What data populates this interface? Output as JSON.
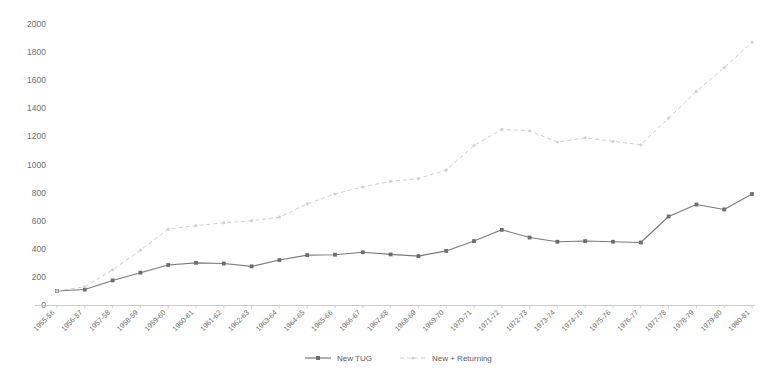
{
  "chart_data": {
    "type": "line",
    "title": "",
    "subtitle": "",
    "xlabel": "",
    "ylabel": "",
    "ylim": [
      0,
      2000
    ],
    "ytick_step": 200,
    "yticks": [
      0,
      200,
      400,
      600,
      800,
      1000,
      1200,
      1400,
      1600,
      1800,
      2000
    ],
    "ytick_labels": [
      "0",
      "200",
      "400",
      "600",
      "800",
      "1000",
      "1200",
      "1400",
      "1600",
      "1800",
      "2000"
    ],
    "grid": false,
    "legend_position": "bottom",
    "categories": [
      "1955-56",
      "1956-57",
      "1957-58",
      "1958-59",
      "1959-60",
      "1960-61",
      "1961-62",
      "1962-63",
      "1963-64",
      "1964-65",
      "1965-66",
      "1966-67",
      "1967-68",
      "1968-69",
      "1969-70",
      "1970-71",
      "1971-72",
      "1972-73",
      "1973-74",
      "1974-75",
      "1975-76",
      "1976-77",
      "1977-78",
      "1978-79",
      "1979-80",
      "1980-81"
    ],
    "series": [
      {
        "name": "New TUG",
        "style": "solid",
        "color": "#7a7a7a",
        "marker": "square",
        "values": [
          100,
          110,
          175,
          230,
          285,
          300,
          295,
          275,
          320,
          355,
          358,
          375,
          360,
          348,
          385,
          455,
          535,
          480,
          450,
          455,
          450,
          445,
          630,
          715,
          680,
          790
        ]
      },
      {
        "name": "New + Returning",
        "style": "dashed",
        "color": "#cfcfcf",
        "marker": "dot",
        "values": [
          100,
          130,
          250,
          390,
          540,
          565,
          585,
          600,
          625,
          720,
          790,
          840,
          880,
          900,
          960,
          1135,
          1250,
          1240,
          1160,
          1190,
          1165,
          1140,
          1330,
          1520,
          1690,
          1870
        ]
      }
    ],
    "legend": [
      {
        "label": "New TUG",
        "style": "solid",
        "color": "#7a7a7a"
      },
      {
        "label": "New + Returning",
        "style": "dashed",
        "color": "#cfcfcf"
      }
    ]
  }
}
